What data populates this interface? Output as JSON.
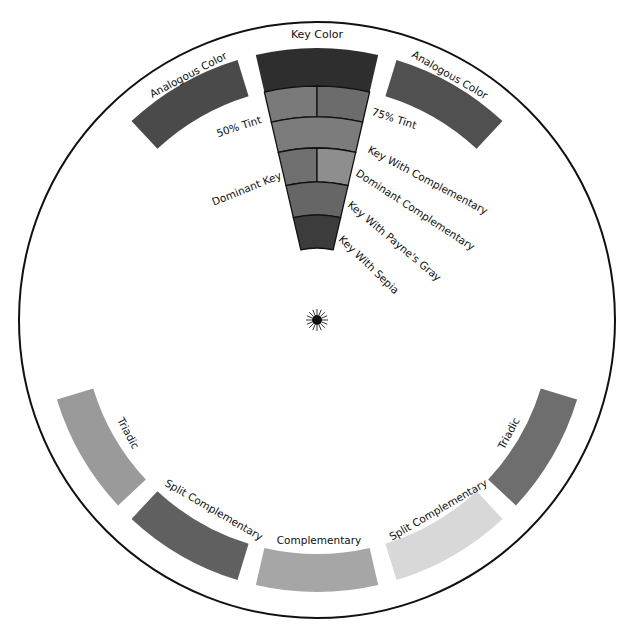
{
  "diagram": {
    "center": [
      317,
      320
    ],
    "outer_radius": 298,
    "band_inner_radius": 234,
    "band_outer_radius": 272,
    "outer_ring": [
      {
        "id": "key-color",
        "label": "Key Color",
        "angle": 0,
        "color": "#2e2e2e"
      },
      {
        "id": "analogous-left",
        "label": "Analogous Color",
        "angle": -30,
        "color": "#4a4a4a"
      },
      {
        "id": "analogous-right",
        "label": "Analogous Color",
        "angle": 30,
        "color": "#505050"
      },
      {
        "id": "triadic-left",
        "label": "Triadic",
        "angle": -120,
        "color": "#9a9a9a"
      },
      {
        "id": "triadic-right",
        "label": "Triadic",
        "angle": 120,
        "color": "#6e6e6e"
      },
      {
        "id": "split-comp-left",
        "label": "Split Complementary",
        "angle": -150,
        "color": "#606060"
      },
      {
        "id": "split-comp-right",
        "label": "Split Complementary",
        "angle": 150,
        "color": "#d8d8d8"
      },
      {
        "id": "complementary",
        "label": "Complementary",
        "angle": 180,
        "color": "#a6a6a6"
      }
    ],
    "key_wedge": {
      "half_angle": 13,
      "bands": [
        {
          "id": "tint",
          "r_outer": 234,
          "r_inner": 203,
          "left": {
            "label": "50% Tint",
            "color": "#7a7a7a"
          },
          "right": {
            "label": "75% Tint",
            "color": "#6c6c6c"
          }
        },
        {
          "id": "key-with-complementary",
          "r_outer": 203,
          "r_inner": 172,
          "full": {
            "label": "Key With Complementary",
            "color": "#7c7c7c"
          }
        },
        {
          "id": "dominant",
          "r_outer": 172,
          "r_inner": 138,
          "left": {
            "label": "Dominant Key",
            "color": "#707070"
          },
          "right": {
            "label": "Dominant Complementary",
            "color": "#8e8e8e"
          }
        },
        {
          "id": "key-with-paynes-gray",
          "r_outer": 138,
          "r_inner": 105,
          "full": {
            "label": "Key With Payne's Gray",
            "color": "#666666"
          }
        },
        {
          "id": "key-with-sepia",
          "r_outer": 105,
          "r_inner": 72,
          "full": {
            "label": "Key With Sepia",
            "color": "#3c3c3c"
          }
        }
      ]
    },
    "center_mark": {
      "icon": "sun-burst-icon"
    }
  },
  "labels": {
    "key_color": "Key Color",
    "analogous_left": "Analogous Color",
    "analogous_right": "Analogous Color",
    "tint_50": "50% Tint",
    "tint_75": "75% Tint",
    "key_with_complementary": "Key With Complementary",
    "dominant_key": "Dominant Key",
    "dominant_complementary": "Dominant Complementary",
    "key_with_paynes_gray": "Key With Payne's Gray",
    "key_with_sepia": "Key With Sepia",
    "triadic_left": "Triadic",
    "triadic_right": "Triadic",
    "split_comp_left": "Split Complementary",
    "split_comp_right": "Split Complementary",
    "complementary": "Complementary"
  }
}
